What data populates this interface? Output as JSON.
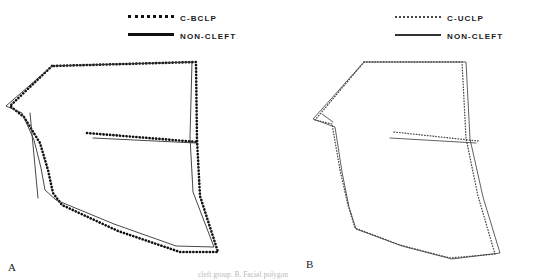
{
  "figure": {
    "background": "#ffffff",
    "caption_partial": "cleft group.  B. Facial polygon"
  },
  "panels": [
    {
      "letter": "A",
      "legend": [
        {
          "label": "C-BCLP",
          "style": "dotted",
          "icon": "dotted-line-icon"
        },
        {
          "label": "NON-CLEFT",
          "style": "solid",
          "icon": "solid-line-icon"
        }
      ]
    },
    {
      "letter": "B",
      "legend": [
        {
          "label": "C-UCLP",
          "style": "dotted",
          "icon": "dotted-line-icon"
        },
        {
          "label": "NON-CLEFT",
          "style": "solid",
          "icon": "solid-line-icon"
        }
      ]
    }
  ],
  "chart_data": {
    "type": "line",
    "title": "",
    "xlabel": "",
    "ylabel": "",
    "grid": false,
    "legend_position": "top-center",
    "panels": [
      {
        "letter": "A",
        "series": [
          {
            "name": "C-BCLP",
            "style": "dotted",
            "color": "#111111",
            "points": [
              [
                52,
                66
              ],
              [
                10,
                106
              ],
              [
                24,
                117
              ],
              [
                40,
                143
              ],
              [
                48,
                170
              ],
              [
                53,
                193
              ],
              [
                62,
                205
              ],
              [
                118,
                231
              ],
              [
                180,
                252
              ],
              [
                218,
                252
              ],
              [
                200,
                196
              ],
              [
                197,
                140
              ],
              [
                196,
                62
              ],
              [
                52,
                66
              ]
            ]
          },
          {
            "name": "NON-CLEFT",
            "style": "solid",
            "color": "#333333",
            "points": [
              [
                52,
                66
              ],
              [
                6,
                106
              ],
              [
                22,
                113
              ],
              [
                34,
                140
              ],
              [
                41,
                168
              ],
              [
                45,
                190
              ],
              [
                56,
                200
              ],
              [
                114,
                224
              ],
              [
                176,
                246
              ],
              [
                214,
                247
              ],
              [
                193,
                192
              ],
              [
                190,
                137
              ],
              [
                192,
                62
              ],
              [
                52,
                66
              ]
            ]
          },
          {
            "name": "internal-line-dotted",
            "style": "dotted",
            "color": "#111111",
            "points": [
              [
                87,
                133
              ],
              [
                198,
                142
              ]
            ]
          },
          {
            "name": "internal-line-solid",
            "style": "solid",
            "color": "#333333",
            "points": [
              [
                93,
                138
              ],
              [
                196,
                143
              ]
            ]
          },
          {
            "name": "nasal-stem",
            "style": "solid",
            "color": "#333333",
            "points": [
              [
                30,
                113
              ],
              [
                38,
                198
              ]
            ]
          }
        ]
      },
      {
        "letter": "B",
        "series": [
          {
            "name": "C-UCLP",
            "style": "dotted",
            "color": "#4a4a4a",
            "points": [
              [
                364,
                62
              ],
              [
                315,
                120
              ],
              [
                332,
                124
              ],
              [
                340,
                170
              ],
              [
                348,
                205
              ],
              [
                355,
                228
              ],
              [
                400,
                245
              ],
              [
                450,
                258
              ],
              [
                495,
                254
              ],
              [
                478,
                196
              ],
              [
                466,
                138
              ],
              [
                462,
                62
              ],
              [
                364,
                62
              ]
            ]
          },
          {
            "name": "NON-CLEFT",
            "style": "solid",
            "color": "#444444",
            "points": [
              [
                364,
                62
              ],
              [
                313,
                119
              ],
              [
                335,
                127
              ],
              [
                342,
                172
              ],
              [
                349,
                207
              ],
              [
                356,
                229
              ],
              [
                402,
                246
              ],
              [
                452,
                259
              ],
              [
                500,
                253
              ],
              [
                483,
                197
              ],
              [
                470,
                139
              ],
              [
                466,
                62
              ],
              [
                364,
                62
              ]
            ]
          },
          {
            "name": "internal-line-dotted",
            "style": "dotted",
            "color": "#4a4a4a",
            "points": [
              [
                394,
                132
              ],
              [
                478,
                141
              ]
            ]
          },
          {
            "name": "internal-line-solid",
            "style": "solid",
            "color": "#444444",
            "points": [
              [
                390,
                138
              ],
              [
                476,
                143
              ]
            ]
          },
          {
            "name": "nasal-stem",
            "style": "solid",
            "color": "#444444",
            "points": [
              [
                322,
                114
              ],
              [
                333,
                122
              ]
            ]
          }
        ]
      }
    ]
  }
}
